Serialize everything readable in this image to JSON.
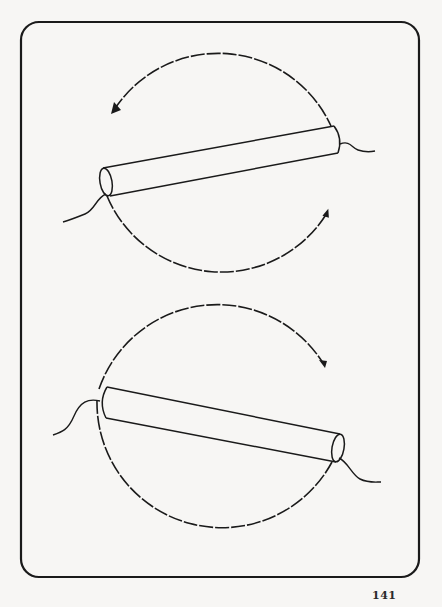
{
  "page": {
    "number": "141",
    "background": "#f7f6f4",
    "ink": "#1a1a1a"
  },
  "figure": {
    "frame": {
      "x": 21,
      "y": 22,
      "w": 398,
      "h": 555,
      "radius": 18
    },
    "panels": [
      {
        "name": "top-rotation",
        "circle": {
          "cx": 222,
          "cy": 164,
          "r": 124
        },
        "arrows": [
          {
            "name": "counterclockwise-arrow-top",
            "direction": "counterclockwise"
          },
          {
            "name": "counterclockwise-arrow-bottom",
            "direction": "counterclockwise"
          }
        ],
        "rod": {
          "from": [
            105,
            180
          ],
          "to": [
            335,
            133
          ]
        }
      },
      {
        "name": "bottom-rotation",
        "circle": {
          "cx": 222,
          "cy": 424,
          "r": 125
        },
        "arrows": [
          {
            "name": "clockwise-arrow-top",
            "direction": "clockwise"
          }
        ],
        "rod": {
          "from": [
            103,
            393
          ],
          "to": [
            335,
            459
          ]
        }
      }
    ]
  }
}
